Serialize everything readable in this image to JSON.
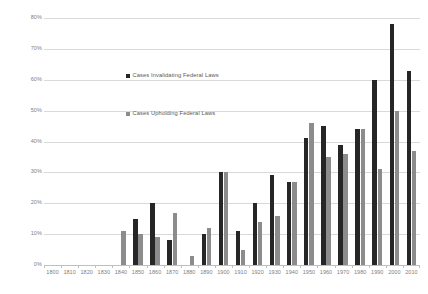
{
  "chart_data": {
    "type": "bar",
    "title": "",
    "subtitle": "",
    "xlabel": "",
    "ylabel": "",
    "ylim": [
      0,
      80
    ],
    "ytick_labels": [
      "0%",
      "10%",
      "20%",
      "30%",
      "40%",
      "50%",
      "60%",
      "70%",
      "80%"
    ],
    "ytick_values": [
      0,
      10,
      20,
      30,
      40,
      50,
      60,
      70,
      80
    ],
    "grid": true,
    "legend_position": "inside-upper-left",
    "categories": [
      "1800",
      "1810",
      "1820",
      "1830",
      "1840",
      "1850",
      "1860",
      "1870",
      "1880",
      "1890",
      "1900",
      "1910",
      "1920",
      "1930",
      "1940",
      "1950",
      "1960",
      "1970",
      "1980",
      "1990",
      "2000",
      "2010"
    ],
    "series": [
      {
        "name": "Cases Invalidating Federal Laws",
        "color": "#262626",
        "values": [
          0,
          0,
          0,
          0,
          0,
          15,
          20,
          8,
          0,
          10,
          30,
          11,
          20,
          29,
          27,
          41,
          45,
          39,
          44,
          60,
          78,
          63
        ]
      },
      {
        "name": "Cases Upholding Federal Laws",
        "color": "#8c8c8c",
        "values": [
          0,
          0,
          0,
          0,
          11,
          10,
          9,
          17,
          3,
          12,
          30,
          5,
          14,
          16,
          27,
          46,
          35,
          36,
          44,
          31,
          50,
          37
        ]
      }
    ]
  },
  "legend": {
    "entries": [
      {
        "label": "Cases Invalidating Federal Laws"
      },
      {
        "label": "Cases Upholding Federal Laws"
      }
    ]
  },
  "colors": {
    "series_invalidating": "#262626",
    "series_upholding": "#8c8c8c",
    "gridline": "#d9d9d9",
    "axis": "#bfbfbf",
    "tick_text": "#808080",
    "legend_text": "#595959",
    "background": "#ffffff"
  }
}
